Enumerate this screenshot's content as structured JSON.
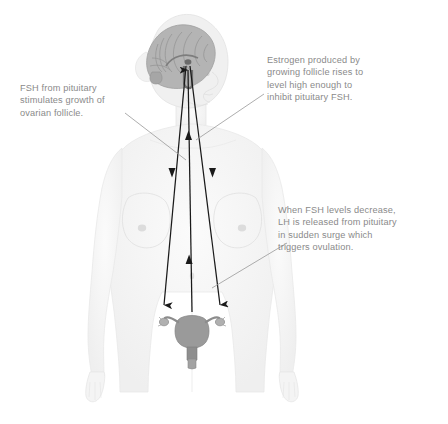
{
  "diagram": {
    "background_color": "#ffffff",
    "text_color": "#8a8a8a",
    "body_fill": "#f2f2f2",
    "body_stroke": "#e2e2e2",
    "brain_fill": "#b8b8b8",
    "uterus_fill": "#9a9a9a",
    "arrow_color": "#1a1a1a",
    "leader_color": "#9a9a9a"
  },
  "callouts": [
    {
      "id": "fsh-follicle",
      "text": "FSH from pituitary\nstimulates growth of\novarian follicle.",
      "position": "left"
    },
    {
      "id": "estrogen-inhibit",
      "text": "Estrogen produced by\ngrowing follicle rises to\nlevel high enough to\ninhibit pituitary FSH.",
      "position": "upper-right"
    },
    {
      "id": "lh-surge",
      "text": "When FSH levels decrease,\nLH is released from pituitary\nin sudden surge which\n    triggers ovulation.",
      "position": "lower-right"
    }
  ],
  "anatomy": {
    "figure_label": "female-body-silhouette",
    "brain_label": "brain-sagittal-section",
    "pituitary_label": "pituitary-gland",
    "uterus_label": "uterus-with-ovaries",
    "ovary_left_label": "left-ovary",
    "ovary_right_label": "right-ovary"
  },
  "arrows": [
    {
      "id": "fsh-down-left",
      "direction": "down",
      "from": "pituitary",
      "to": "left-ovary"
    },
    {
      "id": "fsh-down-right",
      "direction": "down",
      "from": "pituitary",
      "to": "right-ovary"
    },
    {
      "id": "estrogen-up-center",
      "direction": "up",
      "from": "ovary",
      "to": "pituitary"
    }
  ]
}
